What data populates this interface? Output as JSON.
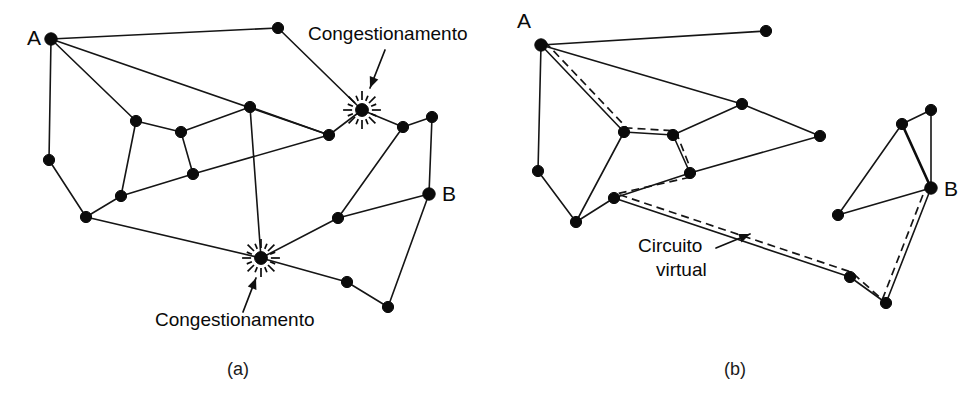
{
  "figure": {
    "background_color": "#ffffff",
    "ink_color": "#0b0b0b",
    "width": 974,
    "height": 403
  },
  "panels": [
    {
      "id": "a",
      "caption": "(a)",
      "caption_pos": {
        "x": 238,
        "y": 375
      },
      "endpoint_labels": [
        {
          "name": "A",
          "text": "A",
          "x": 27,
          "y": 45
        },
        {
          "name": "B",
          "text": "B",
          "x": 442,
          "y": 201
        }
      ],
      "annotations": [
        {
          "name": "congestion-label-top",
          "text": "Congestionamento",
          "x": 308,
          "y": 40,
          "arrow": {
            "x1": 385,
            "y1": 50,
            "x2": 370,
            "y2": 88
          }
        },
        {
          "name": "congestion-label-bottom",
          "text": "Congestionamento",
          "x": 155,
          "y": 326,
          "arrow": {
            "x1": 243,
            "y1": 312,
            "x2": 256,
            "y2": 278
          }
        }
      ],
      "nodes": [
        {
          "id": "A",
          "x": 51,
          "y": 39,
          "r": 6.2,
          "type": "endpoint"
        },
        {
          "id": "n1",
          "x": 278,
          "y": 28,
          "r": 5.6,
          "type": "plain"
        },
        {
          "id": "n2",
          "x": 49,
          "y": 160,
          "r": 5.6,
          "type": "plain"
        },
        {
          "id": "n3",
          "x": 136,
          "y": 121,
          "r": 5.6,
          "type": "plain"
        },
        {
          "id": "n4",
          "x": 181,
          "y": 132,
          "r": 5.6,
          "type": "plain"
        },
        {
          "id": "n5",
          "x": 193,
          "y": 174,
          "r": 5.6,
          "type": "plain"
        },
        {
          "id": "n6",
          "x": 121,
          "y": 196,
          "r": 5.6,
          "type": "plain"
        },
        {
          "id": "n7",
          "x": 86,
          "y": 217,
          "r": 5.6,
          "type": "plain"
        },
        {
          "id": "n8",
          "x": 250,
          "y": 107,
          "r": 5.6,
          "type": "plain"
        },
        {
          "id": "n9",
          "x": 329,
          "y": 135,
          "r": 5.6,
          "type": "plain"
        },
        {
          "id": "S1",
          "x": 362,
          "y": 110,
          "r": 6.4,
          "type": "congestion"
        },
        {
          "id": "n10",
          "x": 403,
          "y": 127,
          "r": 5.6,
          "type": "plain"
        },
        {
          "id": "n11",
          "x": 432,
          "y": 117,
          "r": 5.6,
          "type": "plain"
        },
        {
          "id": "B",
          "x": 429,
          "y": 194,
          "r": 6.2,
          "type": "endpoint"
        },
        {
          "id": "n12",
          "x": 338,
          "y": 218,
          "r": 5.6,
          "type": "plain"
        },
        {
          "id": "S2",
          "x": 261,
          "y": 258,
          "r": 6.4,
          "type": "congestion"
        },
        {
          "id": "n13",
          "x": 347,
          "y": 282,
          "r": 5.6,
          "type": "plain"
        },
        {
          "id": "n14",
          "x": 388,
          "y": 307,
          "r": 5.6,
          "type": "plain"
        }
      ],
      "edges": [
        [
          "A",
          "n1"
        ],
        [
          "A",
          "n2"
        ],
        [
          "A",
          "n3"
        ],
        [
          "A",
          "n9"
        ],
        [
          "n1",
          "S1"
        ],
        [
          "n2",
          "n7"
        ],
        [
          "n3",
          "n4"
        ],
        [
          "n3",
          "n6"
        ],
        [
          "n4",
          "n5"
        ],
        [
          "n4",
          "n8"
        ],
        [
          "n5",
          "n6"
        ],
        [
          "n5",
          "n9"
        ],
        [
          "n6",
          "n7"
        ],
        [
          "n7",
          "S2"
        ],
        [
          "n8",
          "n9"
        ],
        [
          "n8",
          "S2"
        ],
        [
          "n9",
          "S1"
        ],
        [
          "S1",
          "n10"
        ],
        [
          "n10",
          "n11"
        ],
        [
          "n10",
          "n12"
        ],
        [
          "n11",
          "B"
        ],
        [
          "B",
          "n12"
        ],
        [
          "B",
          "n14"
        ],
        [
          "n12",
          "S2"
        ],
        [
          "S2",
          "n13"
        ],
        [
          "n13",
          "n14"
        ]
      ]
    },
    {
      "id": "b",
      "caption": "(b)",
      "caption_pos": {
        "x": 735,
        "y": 375
      },
      "endpoint_labels": [
        {
          "name": "A",
          "text": "A",
          "x": 517,
          "y": 28
        },
        {
          "name": "B",
          "text": "B",
          "x": 944,
          "y": 196
        }
      ],
      "annotations": [
        {
          "name": "virtual-circuit-label",
          "text_line1": "Circuito",
          "text_line2": "virtual",
          "x": 638,
          "y": 252,
          "line2_x": 656,
          "line2_y": 276,
          "arrow": {
            "x1": 716,
            "y1": 248,
            "x2": 750,
            "y2": 234
          }
        }
      ],
      "nodes": [
        {
          "id": "A",
          "x": 541,
          "y": 45,
          "r": 6.2,
          "type": "endpoint"
        },
        {
          "id": "m1",
          "x": 766,
          "y": 31,
          "r": 5.6,
          "type": "plain"
        },
        {
          "id": "m2",
          "x": 538,
          "y": 171,
          "r": 5.6,
          "type": "plain"
        },
        {
          "id": "m3",
          "x": 624,
          "y": 132,
          "r": 5.6,
          "type": "plain"
        },
        {
          "id": "m4",
          "x": 673,
          "y": 135,
          "r": 5.6,
          "type": "plain"
        },
        {
          "id": "m5",
          "x": 690,
          "y": 173,
          "r": 5.6,
          "type": "plain"
        },
        {
          "id": "m6",
          "x": 614,
          "y": 198,
          "r": 5.6,
          "type": "plain"
        },
        {
          "id": "m7",
          "x": 576,
          "y": 222,
          "r": 5.6,
          "type": "plain"
        },
        {
          "id": "m8",
          "x": 742,
          "y": 104,
          "r": 5.6,
          "type": "plain"
        },
        {
          "id": "m9",
          "x": 820,
          "y": 136,
          "r": 5.6,
          "type": "plain"
        },
        {
          "id": "m10",
          "x": 902,
          "y": 124,
          "r": 5.6,
          "type": "plain"
        },
        {
          "id": "m11",
          "x": 931,
          "y": 110,
          "r": 5.6,
          "type": "plain"
        },
        {
          "id": "B",
          "x": 931,
          "y": 188,
          "r": 6.2,
          "type": "endpoint"
        },
        {
          "id": "m12",
          "x": 838,
          "y": 215,
          "r": 5.6,
          "type": "plain"
        },
        {
          "id": "m13",
          "x": 850,
          "y": 277,
          "r": 5.6,
          "type": "plain"
        },
        {
          "id": "m14",
          "x": 886,
          "y": 303,
          "r": 5.6,
          "type": "plain"
        }
      ],
      "edges": [
        [
          "A",
          "m1"
        ],
        [
          "A",
          "m2"
        ],
        [
          "A",
          "m3"
        ],
        [
          "A",
          "m8"
        ],
        [
          "m2",
          "m7"
        ],
        [
          "m3",
          "m4"
        ],
        [
          "m3",
          "m7"
        ],
        [
          "m4",
          "m5"
        ],
        [
          "m4",
          "m8"
        ],
        [
          "m5",
          "m6"
        ],
        [
          "m5",
          "m9"
        ],
        [
          "m6",
          "m7"
        ],
        [
          "m6",
          "m13"
        ],
        [
          "m8",
          "m9"
        ],
        [
          "m10",
          "m11"
        ],
        [
          "m10",
          "m12"
        ],
        [
          "m11",
          "B"
        ],
        [
          "B",
          "m12"
        ],
        [
          "B",
          "m14"
        ],
        [
          "m13",
          "m14"
        ]
      ],
      "thick_edges": [
        [
          "m10",
          "B"
        ]
      ],
      "virtual_circuit": {
        "name": "virtual-circuit-path",
        "style": "dashed",
        "path": [
          "A",
          "m3",
          "m4",
          "m5",
          "m6",
          "m13",
          "m14",
          "B"
        ],
        "offset": 5
      }
    }
  ]
}
